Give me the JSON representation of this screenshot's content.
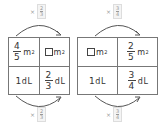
{
  "left_panel": {
    "top_multiplier": {
      "symbol": "×",
      "numerator": "2",
      "denominator": "3"
    },
    "bottom_multiplier": {
      "symbol": "×",
      "numerator": "2",
      "denominator": "3"
    },
    "cells": {
      "top_left": {
        "numerator": "4",
        "denominator": "5",
        "unit": "m",
        "exp": "2"
      },
      "top_right": {
        "unknown": "□",
        "unit": "m",
        "exp": "2"
      },
      "bottom_left": {
        "value": "1",
        "unit": "dL"
      },
      "bottom_right": {
        "numerator": "2",
        "denominator": "3",
        "unit": "dL"
      }
    }
  },
  "right_panel": {
    "top_multiplier": {
      "symbol": "×",
      "numerator": "3",
      "denominator": "4"
    },
    "bottom_multiplier": {
      "symbol": "×",
      "numerator": "3",
      "denominator": "4"
    },
    "cells": {
      "top_left": {
        "unknown": "□",
        "unit": "m",
        "exp": "2"
      },
      "top_right": {
        "numerator": "2",
        "denominator": "5",
        "unit": "m",
        "exp": "2"
      },
      "bottom_left": {
        "value": "1",
        "unit": "dL"
      },
      "bottom_right": {
        "numerator": "3",
        "denominator": "4",
        "unit": "dL"
      }
    }
  },
  "colors": {
    "line": "#777777",
    "text": "#333333",
    "multiplier_text": "#999999"
  }
}
